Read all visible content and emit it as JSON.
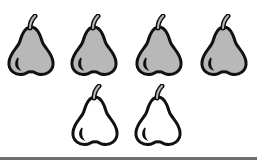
{
  "scene": {
    "description": "Pears arranged in two rows",
    "rows": [
      {
        "pears": [
          {
            "fill": "gray",
            "x": 4,
            "y": 14
          },
          {
            "fill": "gray",
            "x": 67,
            "y": 14
          },
          {
            "fill": "gray",
            "x": 132,
            "y": 14
          },
          {
            "fill": "gray",
            "x": 197,
            "y": 14
          }
        ]
      },
      {
        "pears": [
          {
            "fill": "white",
            "x": 68,
            "y": 84
          },
          {
            "fill": "white",
            "x": 131,
            "y": 84
          }
        ]
      }
    ],
    "counts": {
      "gray": 4,
      "white": 2,
      "total": 6
    },
    "colors": {
      "gray_fill": "#b8b8b8",
      "white_fill": "#ffffff",
      "outline": "#111111",
      "baseline": "#6e6e6e"
    }
  }
}
